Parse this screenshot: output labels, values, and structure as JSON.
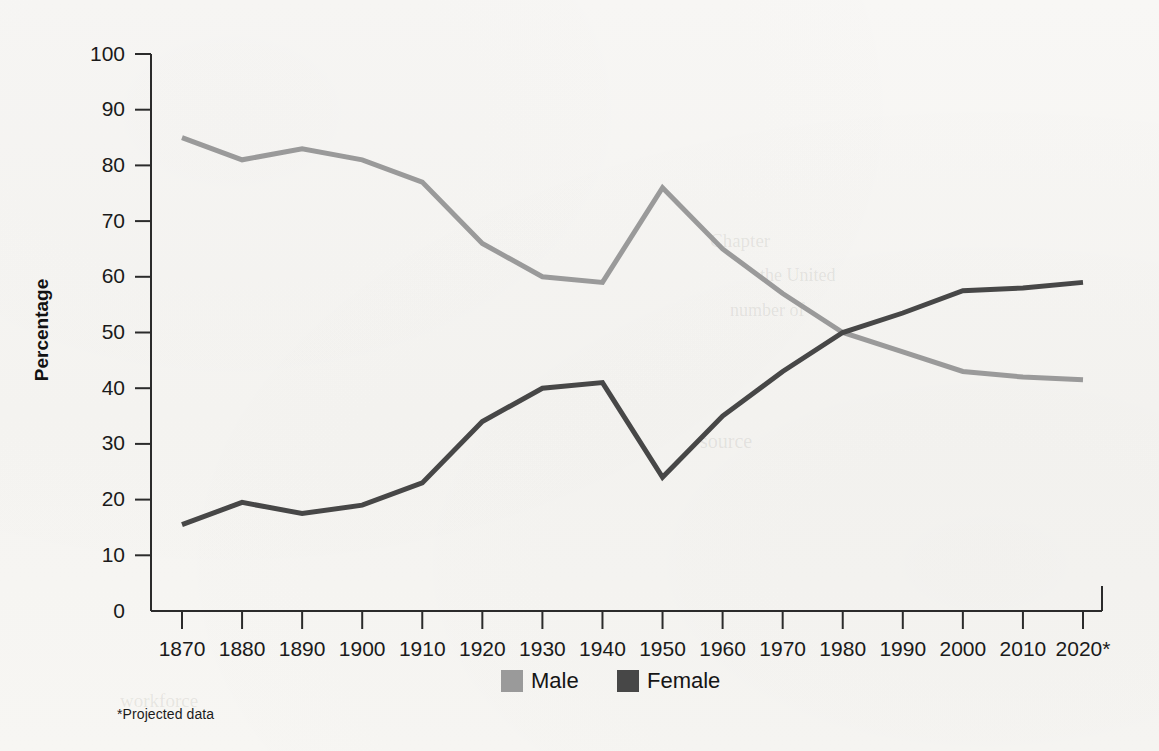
{
  "chart_data": {
    "type": "line",
    "title": "",
    "xlabel": "",
    "ylabel": "Percentage",
    "ylim": [
      0,
      100
    ],
    "ytick_step": 10,
    "grid": false,
    "legend_position": "bottom",
    "categories": [
      "1870",
      "1880",
      "1890",
      "1900",
      "1910",
      "1920",
      "1930",
      "1940",
      "1950",
      "1960",
      "1970",
      "1980",
      "1990",
      "2000",
      "2010",
      "2020*"
    ],
    "yticks": [
      "0",
      "10",
      "20",
      "30",
      "40",
      "50",
      "60",
      "70",
      "80",
      "90",
      "100"
    ],
    "series": [
      {
        "name": "Male",
        "color": "#9a9a9a",
        "values": [
          85,
          81,
          83,
          81,
          77,
          66,
          60,
          59,
          76,
          65,
          57,
          50,
          46.5,
          43,
          42,
          41.5
        ]
      },
      {
        "name": "Female",
        "color": "#474747",
        "values": [
          15.5,
          19.5,
          17.5,
          19,
          23,
          34,
          40,
          41,
          24,
          35,
          43,
          50,
          53.5,
          57.5,
          58,
          59
        ]
      }
    ],
    "annotations": [
      "*Projected data"
    ]
  },
  "axis": {
    "y_title": "Percentage"
  },
  "legend": {
    "items": [
      {
        "label": "Male",
        "color": "#9a9a9a"
      },
      {
        "label": "Female",
        "color": "#474747"
      }
    ]
  },
  "footnote": {
    "text": "*Projected data"
  },
  "ghost_text": {
    "lines": [
      "Chapter",
      "the United",
      "number of",
      "source",
      "workforce"
    ]
  }
}
